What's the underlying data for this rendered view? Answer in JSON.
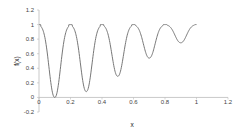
{
  "chart_data": {
    "type": "line",
    "title": "",
    "xlabel": "x",
    "ylabel": "f(x)",
    "xlim": [
      0,
      1.2
    ],
    "ylim": [
      -0.2,
      1.2
    ],
    "x_ticks": [
      "0",
      "0.2",
      "0.4",
      "0.6",
      "0.8",
      "1",
      "1.2"
    ],
    "y_ticks": [
      "1.2",
      "1",
      "0.8",
      "0.6",
      "0.4",
      "0.2",
      "0",
      "-0.2"
    ],
    "grid": false,
    "legend": null,
    "series": [
      {
        "name": "f(x)",
        "color": "#777777",
        "minima": [
          {
            "x": 0.1,
            "y": 0.0
          },
          {
            "x": 0.3,
            "y": 0.08
          },
          {
            "x": 0.5,
            "y": 0.29
          },
          {
            "x": 0.7,
            "y": 0.54
          },
          {
            "x": 0.9,
            "y": 0.75
          }
        ],
        "plateau_value": 1.0,
        "x_range": [
          0,
          1
        ]
      }
    ]
  }
}
